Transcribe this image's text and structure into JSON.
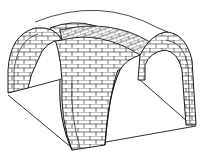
{
  "figure": {
    "stroke_color": "#1a1a1a",
    "background": "#ffffff",
    "brick_fill": "#ffffff"
  }
}
